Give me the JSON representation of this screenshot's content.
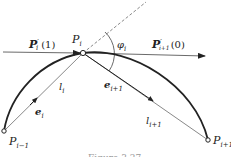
{
  "diagram": {
    "points": {
      "p_i": {
        "label": "P",
        "sub": "i",
        "x": 83,
        "y": 53
      },
      "p_i_minus_1": {
        "label": "P",
        "sub": "i−1",
        "x": 4,
        "y": 131
      },
      "p_i_plus_1": {
        "label": "P",
        "sub": "i+1",
        "x": 208,
        "y": 140
      }
    },
    "tangents": {
      "left": {
        "label": "P",
        "prime": "′",
        "sub": "i",
        "arg": "(1)"
      },
      "right": {
        "label": "P",
        "prime": "′",
        "sub": "i+1",
        "arg": "(0)"
      }
    },
    "chords": {
      "l_i": {
        "label": "l",
        "sub": "i"
      },
      "l_i_plus_1": {
        "label": "l",
        "sub": "i+1"
      }
    },
    "unit_vectors": {
      "e_i": {
        "label": "e",
        "sub": "i"
      },
      "e_i_plus_1": {
        "label": "e",
        "sub": "i+1"
      }
    },
    "angle": {
      "label": "φ",
      "sub": "i"
    },
    "caption": "Figure 3.27",
    "colors": {
      "ink": "#222222",
      "thin": "#555555",
      "caption": "#aaaaaa"
    }
  }
}
